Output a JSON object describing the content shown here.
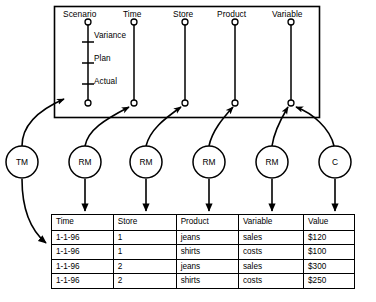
{
  "diagram": {
    "cube_box": {
      "dimensions": [
        {
          "name": "Scenario",
          "members": [
            "Variance",
            "Plan",
            "Actual"
          ]
        },
        {
          "name": "Time",
          "members": []
        },
        {
          "name": "Store",
          "members": []
        },
        {
          "name": "Product",
          "members": []
        },
        {
          "name": "Variable",
          "members": []
        }
      ]
    },
    "mapping_nodes": [
      {
        "id": "node-tm",
        "label": "TM"
      },
      {
        "id": "node-rm1",
        "label": "RM"
      },
      {
        "id": "node-rm2",
        "label": "RM"
      },
      {
        "id": "node-rm3",
        "label": "RM"
      },
      {
        "id": "node-rm4",
        "label": "RM"
      },
      {
        "id": "node-c",
        "label": "C"
      }
    ],
    "table": {
      "headers": [
        "Time",
        "Store",
        "Product",
        "Variable",
        "Value"
      ],
      "rows": [
        [
          "1-1-96",
          "1",
          "jeans",
          "sales",
          "$120"
        ],
        [
          "1-1-96",
          "1",
          "shirts",
          "costs",
          "$100"
        ],
        [
          "1-1-96",
          "2",
          "jeans",
          "sales",
          "$300"
        ],
        [
          "1-1-96",
          "2",
          "shirts",
          "costs",
          "$250"
        ]
      ]
    },
    "colors": {
      "stroke": "#000000",
      "background": "#ffffff"
    }
  }
}
